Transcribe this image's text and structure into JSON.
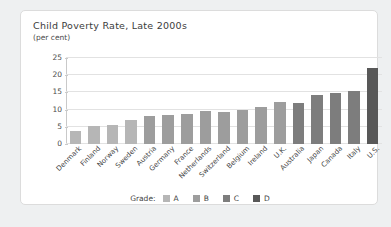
{
  "card": {
    "title": "Child Poverty Rate, Late 2000s",
    "subtitle": "(per cent)"
  },
  "legend": {
    "title": "Grade:",
    "items": [
      {
        "label": "A",
        "color": "#b6b6b6"
      },
      {
        "label": "B",
        "color": "#9d9d9d"
      },
      {
        "label": "C",
        "color": "#7d7d7d"
      },
      {
        "label": "D",
        "color": "#585858"
      }
    ]
  },
  "chart_data": {
    "type": "bar",
    "title": "Child Poverty Rate, Late 2000s",
    "subtitle": "(per cent)",
    "xlabel": "",
    "ylabel": "per cent",
    "ylim": [
      0,
      25
    ],
    "yticks": [
      0,
      5,
      10,
      15,
      20,
      25
    ],
    "grid": true,
    "legend_position": "bottom",
    "categories": [
      "Denmark",
      "Finland",
      "Norway",
      "Sweden",
      "Austria",
      "Germany",
      "France",
      "Netherlands",
      "Switzerland",
      "Belgium",
      "Ireland",
      "U.K.",
      "Australia",
      "Japan",
      "Canada",
      "Italy",
      "U.S."
    ],
    "values": [
      3.7,
      5.3,
      5.5,
      7.0,
      8.0,
      8.5,
      8.8,
      9.6,
      9.4,
      10.0,
      10.7,
      12.2,
      11.8,
      14.2,
      14.8,
      15.3,
      22.0
    ],
    "grades": [
      "A",
      "A",
      "A",
      "A",
      "B",
      "B",
      "B",
      "B",
      "B",
      "B",
      "B",
      "B",
      "C",
      "C",
      "C",
      "C",
      "D"
    ],
    "colors": [
      "#b6b6b6",
      "#b6b6b6",
      "#b6b6b6",
      "#b6b6b6",
      "#9d9d9d",
      "#9d9d9d",
      "#9d9d9d",
      "#9d9d9d",
      "#9d9d9d",
      "#9d9d9d",
      "#9d9d9d",
      "#9d9d9d",
      "#7d7d7d",
      "#7d7d7d",
      "#7d7d7d",
      "#7d7d7d",
      "#585858"
    ]
  }
}
